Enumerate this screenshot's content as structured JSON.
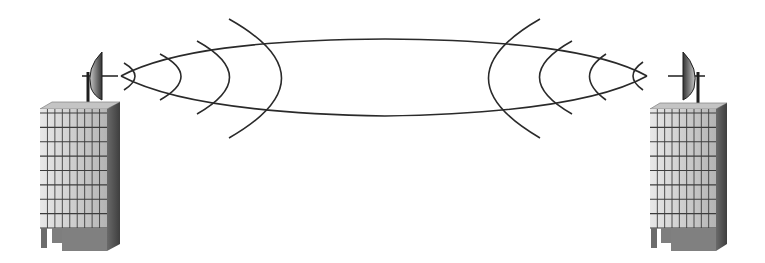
{
  "diagram": {
    "type": "point-to-point microwave link",
    "elements": {
      "left_site": {
        "label": "left-building",
        "antenna": "parabolic-dish",
        "facing": "right"
      },
      "right_site": {
        "label": "right-building",
        "antenna": "parabolic-dish",
        "facing": "left"
      },
      "beam": {
        "label": "microwave-beam",
        "wavefronts_per_side": 4
      }
    }
  },
  "colors": {
    "background": "#ffffff",
    "line": "#2a2a2a",
    "building_front_light": "#e4e4e4",
    "building_front_dark": "#b9b9b9",
    "building_side": "#5a5a5a",
    "building_roof": "#bdbdbd",
    "building_base": "#7a7a7a",
    "grid_line": "#3c3c3c",
    "dish_light": "#b0b0b0",
    "dish_dark": "#3a3a3a"
  },
  "grid": {
    "columns": 9,
    "rows": 8
  }
}
